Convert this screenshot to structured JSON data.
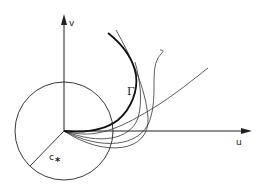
{
  "diagram": {
    "axes": {
      "horizontal_label": "u",
      "vertical_label": "v"
    },
    "labels": {
      "curve": "Γ",
      "radius": "c",
      "radius_subscript": "*"
    },
    "elements": [
      "circle centered at origin with radius c*",
      "radius segment from origin to lower-left on circle",
      "envelope curve Γ (bold)",
      "family of curves emanating from origin, tangent to u-axis, touching Γ"
    ],
    "colors": {
      "stroke": "#222222",
      "background": "#ffffff"
    }
  }
}
